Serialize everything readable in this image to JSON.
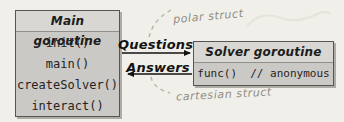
{
  "main_box": {
    "title": "Main goroutine",
    "methods": [
      "init()",
      "main()",
      "createSolver()",
      "interact()"
    ]
  },
  "solver_box": {
    "title": "Solver goroutine",
    "body": "func()  // anonymous"
  },
  "channels": {
    "questions_label": "Questions",
    "answers_label": "Answers"
  },
  "annotations": {
    "top": "polar struct",
    "bottom": "cartesian struct"
  },
  "colors": {
    "background": "#f1efe9",
    "box_fill": "#cbc9c6",
    "header_fill": "#d8d7d3",
    "border": "#575552",
    "shadow": "#aeaca5",
    "arrow": "#131313",
    "annotation_text": "#908d84",
    "dashed_arc": "#b5b2a8"
  }
}
